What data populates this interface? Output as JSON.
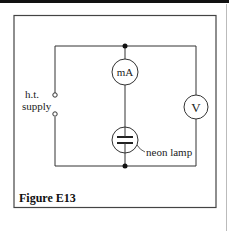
{
  "figure": {
    "caption": "Figure E13",
    "components": {
      "ammeter": {
        "label": "mA",
        "type": "milliammeter"
      },
      "voltmeter": {
        "label": "V",
        "type": "voltmeter"
      },
      "lamp": {
        "label": "neon lamp",
        "type": "neon-lamp"
      },
      "supply": {
        "label_line1": "h.t.",
        "label_line2": "supply",
        "type": "terminals"
      }
    }
  }
}
